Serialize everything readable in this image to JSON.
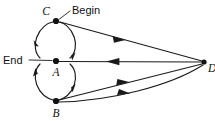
{
  "diagram": {
    "background_color": "#ffffff",
    "stroke_color": "#1a1a1a",
    "node_color": "#111111",
    "nodes": [
      {
        "id": "C",
        "label": "C",
        "x": 56,
        "y": 21,
        "label_x": 50,
        "label_y": 15,
        "label_anchor": "end"
      },
      {
        "id": "A",
        "label": "A",
        "x": 56,
        "y": 61,
        "label_x": 56,
        "label_y": 76,
        "label_anchor": "middle"
      },
      {
        "id": "B",
        "label": "B",
        "x": 56,
        "y": 101,
        "label_x": 56,
        "label_y": 117,
        "label_anchor": "middle"
      },
      {
        "id": "D",
        "label": "D",
        "x": 204,
        "y": 62,
        "label_x": 209,
        "label_y": 72,
        "label_anchor": "start"
      }
    ],
    "annotations": [
      {
        "id": "begin",
        "label": "Begin",
        "x": 72,
        "y": 14,
        "anchor": "start"
      },
      {
        "id": "end",
        "label": "End",
        "x": 4,
        "y": 61,
        "anchor": "start"
      }
    ],
    "edges": [
      {
        "id": "C-to-A-left",
        "from": "C",
        "to": "A",
        "kind": "arc",
        "arrow": "down"
      },
      {
        "id": "C-to-A-right",
        "from": "C",
        "to": "A",
        "kind": "arc",
        "arrow": "down"
      },
      {
        "id": "B-to-A-left",
        "from": "B",
        "to": "A",
        "kind": "arc",
        "arrow": "up"
      },
      {
        "id": "A-to-B-right",
        "from": "A",
        "to": "B",
        "kind": "arc",
        "arrow": "down"
      },
      {
        "id": "C-to-D",
        "from": "C",
        "to": "D",
        "kind": "line",
        "arrow": "toward-D"
      },
      {
        "id": "D-to-A",
        "from": "D",
        "to": "A",
        "kind": "line",
        "arrow": "toward-A"
      },
      {
        "id": "B-to-D-upper",
        "from": "B",
        "to": "D",
        "kind": "line",
        "arrow": "toward-D"
      },
      {
        "id": "B-to-D-lower",
        "from": "B",
        "to": "D",
        "kind": "curve",
        "arrow": "toward-D"
      }
    ]
  }
}
